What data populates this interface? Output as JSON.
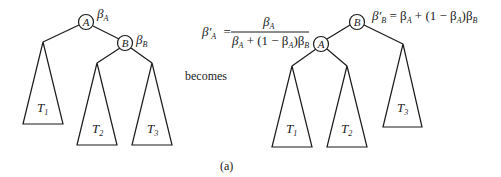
{
  "figure": {
    "caption": "(a)",
    "transition_word": "becomes",
    "line_color": "#1a1a1a",
    "background": "#ffffff"
  },
  "before_tree": {
    "nodes": [
      {
        "id": "A",
        "label": "A",
        "weight_symbol": "β",
        "weight_sub": "A"
      },
      {
        "id": "B",
        "label": "B",
        "weight_symbol": "β",
        "weight_sub": "B"
      }
    ],
    "subtrees": [
      {
        "label": "T",
        "sub": "1",
        "parent": "A",
        "side": "left"
      },
      {
        "label": "T",
        "sub": "2",
        "parent": "B",
        "side": "left"
      },
      {
        "label": "T",
        "sub": "3",
        "parent": "B",
        "side": "right"
      }
    ]
  },
  "after_tree": {
    "nodes": [
      {
        "id": "B",
        "label": "B"
      },
      {
        "id": "A",
        "label": "A"
      }
    ],
    "subtrees": [
      {
        "label": "T",
        "sub": "1",
        "parent": "A",
        "side": "left"
      },
      {
        "label": "T",
        "sub": "2",
        "parent": "A",
        "side": "right"
      },
      {
        "label": "T",
        "sub": "3",
        "parent": "B",
        "side": "right"
      }
    ],
    "formula_A": {
      "lhs": "β′",
      "lhs_sub": "A",
      "eq": "=",
      "numerator": "β",
      "numerator_sub": "A",
      "denominator_parts": [
        "β",
        "A",
        " + (1 − β",
        "A",
        ")β",
        "B"
      ]
    },
    "formula_B": {
      "lhs": "β′",
      "lhs_sub": "B",
      "rhs_parts": [
        " = β",
        "A",
        " + (1 − β",
        "A",
        ")β",
        "B"
      ]
    }
  }
}
